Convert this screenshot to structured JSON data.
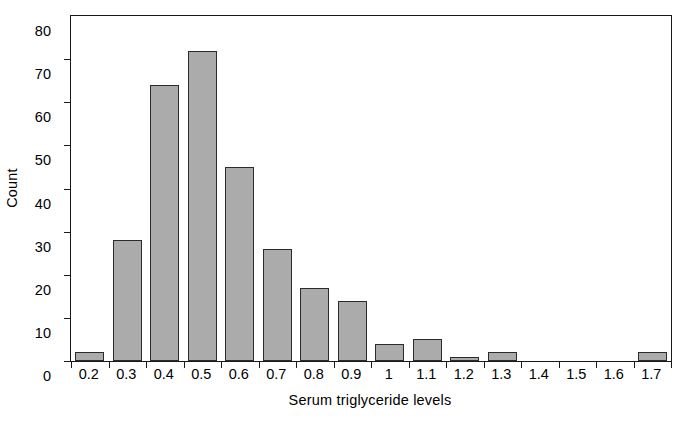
{
  "chart_data": {
    "type": "bar",
    "title": "",
    "subtitle": "",
    "xlabel": "Serum triglyceride levels",
    "ylabel": "Count",
    "categories": [
      "0.2",
      "0.3",
      "0.4",
      "0.5",
      "0.6",
      "0.7",
      "0.8",
      "0.9",
      "1",
      "1.1",
      "1.2",
      "1.3",
      "1.4",
      "1.5",
      "1.6",
      "1.7"
    ],
    "values": [
      2,
      28,
      64,
      72,
      45,
      26,
      17,
      14,
      4,
      5,
      1,
      2,
      0,
      0,
      0,
      2
    ],
    "ylim": [
      0,
      80
    ],
    "yticks": [
      0,
      10,
      20,
      30,
      40,
      50,
      60,
      70,
      80
    ],
    "ytick_labels": [
      "0",
      "10",
      "20",
      "30",
      "40",
      "50",
      "60",
      "70",
      "80"
    ],
    "xtick_labels": [
      "0.2",
      "0.3",
      "0.4",
      "0.5",
      "0.6",
      "0.7",
      "0.8",
      "0.9",
      "1",
      "1.1",
      "1.2",
      "1.3",
      "1.4",
      "1.5",
      "1.6",
      "1.7"
    ],
    "grid": false,
    "legend": null,
    "bar_fill_color": "#ababab",
    "bar_edge_color": "#2b2b2b",
    "axis_color": "#1a1a1a",
    "background_color": "#ffffff"
  }
}
